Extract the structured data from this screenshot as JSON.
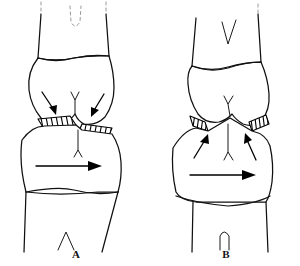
{
  "figure": {
    "caption_present": false,
    "background_color": "#ffffff",
    "ink_color": "#101010",
    "panels": [
      {
        "id": "A",
        "label": "A",
        "label_x": 76,
        "label_y": 258,
        "description": "knee joint anteroposterior line drawing, downward convergent arrows at joint line, horizontal rightward translation arrow across proximal tibia",
        "upper_bone": "femur",
        "lower_bone": "tibia",
        "facet_count": 2,
        "converging_arrow_direction": "down",
        "translation_arrow_direction": "right",
        "top_contour_style": "faded-dashed",
        "distal_notch_shape": "pointed"
      },
      {
        "id": "B",
        "label": "B",
        "label_x": 226,
        "label_y": 258,
        "description": "knee joint anteroposterior line drawing, upward convergent arrows below joint line, horizontal rightward translation arrow across proximal tibia",
        "upper_bone": "femur",
        "lower_bone": "tibia",
        "facet_count": 2,
        "converging_arrow_direction": "up",
        "translation_arrow_direction": "right",
        "top_contour_style": "solid",
        "distal_notch_shape": "rounded"
      }
    ]
  },
  "colors": {
    "ink": "#101010",
    "hatch": "#000000",
    "faded": "#9a9a9a",
    "paper": "#ffffff"
  }
}
